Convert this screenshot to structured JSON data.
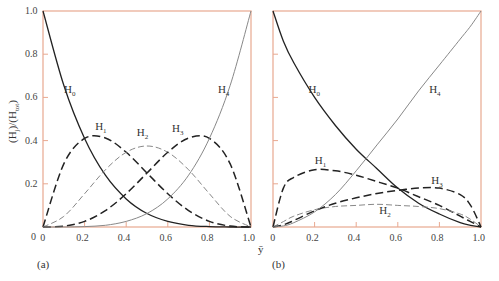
{
  "chart_data": [
    {
      "panel": "(a)",
      "type": "line",
      "ylabel": "(Hj)/(Htot)",
      "xlabel": "ȳ",
      "xlim": [
        0,
        1.0
      ],
      "ylim": [
        0,
        1.0
      ],
      "xticks": [
        "0",
        "0.2",
        "0.4",
        "0.6",
        "0.8",
        "1.0"
      ],
      "yticks": [
        "0",
        "0.2",
        "0.4",
        "0.6",
        "0.8",
        "1.0"
      ],
      "grid": false,
      "x": [
        0,
        0.1,
        0.2,
        0.3,
        0.4,
        0.5,
        0.6,
        0.7,
        0.8,
        0.9,
        1.0
      ],
      "series": [
        {
          "name": "H0",
          "style": "solid-dark",
          "values": [
            1.0,
            0.656,
            0.41,
            0.24,
            0.13,
            0.0625,
            0.026,
            0.008,
            0.002,
            0.0001,
            0
          ]
        },
        {
          "name": "H1",
          "style": "long-dash-dark",
          "values": [
            0,
            0.292,
            0.41,
            0.412,
            0.346,
            0.25,
            0.154,
            0.076,
            0.026,
            0.004,
            0
          ]
        },
        {
          "name": "H2",
          "style": "dash-light",
          "values": [
            0,
            0.049,
            0.154,
            0.265,
            0.346,
            0.375,
            0.346,
            0.265,
            0.154,
            0.049,
            0
          ]
        },
        {
          "name": "H3",
          "style": "long-dash-dark",
          "values": [
            0,
            0.004,
            0.026,
            0.076,
            0.154,
            0.25,
            0.346,
            0.412,
            0.41,
            0.292,
            0
          ]
        },
        {
          "name": "H4",
          "style": "solid-light",
          "values": [
            0,
            0.0001,
            0.002,
            0.008,
            0.026,
            0.0625,
            0.13,
            0.24,
            0.41,
            0.656,
            1.0
          ]
        }
      ],
      "annotations": [
        {
          "text": "H0",
          "x": 0.12,
          "y": 0.63
        },
        {
          "text": "H1",
          "x": 0.27,
          "y": 0.46
        },
        {
          "text": "H2",
          "x": 0.47,
          "y": 0.43
        },
        {
          "text": "H3",
          "x": 0.64,
          "y": 0.45
        },
        {
          "text": "H4",
          "x": 0.86,
          "y": 0.63
        }
      ]
    },
    {
      "panel": "(b)",
      "type": "line",
      "xlabel": "",
      "xlim": [
        0,
        1.0
      ],
      "ylim": [
        0,
        1.0
      ],
      "xticks": [
        "0",
        "0.2",
        "0.4",
        "0.6",
        "0.8",
        "1.0"
      ],
      "grid": false,
      "x": [
        0,
        0.05,
        0.1,
        0.2,
        0.3,
        0.4,
        0.5,
        0.6,
        0.7,
        0.8,
        0.9,
        0.95,
        1.0
      ],
      "series": [
        {
          "name": "H0",
          "style": "solid-dark",
          "values": [
            1.0,
            0.86,
            0.76,
            0.6,
            0.47,
            0.36,
            0.27,
            0.18,
            0.11,
            0.06,
            0.02,
            0.008,
            0
          ]
        },
        {
          "name": "H1",
          "style": "long-dash-dark",
          "values": [
            0,
            0.18,
            0.23,
            0.265,
            0.26,
            0.24,
            0.21,
            0.18,
            0.14,
            0.1,
            0.05,
            0.025,
            0
          ]
        },
        {
          "name": "H2",
          "style": "dash-light",
          "values": [
            0,
            0.025,
            0.05,
            0.08,
            0.095,
            0.1,
            0.105,
            0.1,
            0.095,
            0.085,
            0.06,
            0.035,
            0
          ]
        },
        {
          "name": "H3",
          "style": "long-dash-dark",
          "values": [
            0,
            0.01,
            0.03,
            0.075,
            0.11,
            0.135,
            0.155,
            0.17,
            0.18,
            0.18,
            0.15,
            0.1,
            0
          ]
        },
        {
          "name": "H4",
          "style": "solid-light",
          "values": [
            0,
            0.005,
            0.02,
            0.07,
            0.15,
            0.26,
            0.38,
            0.5,
            0.63,
            0.75,
            0.87,
            0.93,
            1.0
          ]
        }
      ],
      "annotations": [
        {
          "text": "H0",
          "x": 0.19,
          "y": 0.63
        },
        {
          "text": "H1",
          "x": 0.22,
          "y": 0.3
        },
        {
          "text": "H2",
          "x": 0.53,
          "y": 0.07
        },
        {
          "text": "H3",
          "x": 0.78,
          "y": 0.21
        },
        {
          "text": "H4",
          "x": 0.77,
          "y": 0.63
        }
      ]
    }
  ],
  "labels": {
    "ylabel": "(Hj)/(Htot)",
    "xlabel": "ȳ",
    "panel_a": "(a)",
    "panel_b": "(b)",
    "zero": "0"
  },
  "colors": {
    "axes": "#e8a890",
    "dark_line": "#222222",
    "light_line": "#888888"
  }
}
